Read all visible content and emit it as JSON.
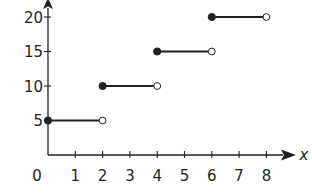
{
  "chart_data": {
    "type": "step",
    "title": "",
    "xlabel": "x",
    "ylabel": "",
    "xlim": [
      0,
      8
    ],
    "ylim": [
      0,
      20
    ],
    "grid": false,
    "x_ticks": [
      "1",
      "2",
      "3",
      "4",
      "5",
      "6",
      "7",
      "8"
    ],
    "y_ticks": [
      "5",
      "10",
      "15",
      "20"
    ],
    "origin_label": "0",
    "segments": [
      {
        "x_start": 0,
        "x_end": 2,
        "y": 5,
        "start": "closed",
        "end": "open"
      },
      {
        "x_start": 2,
        "x_end": 4,
        "y": 10,
        "start": "closed",
        "end": "open"
      },
      {
        "x_start": 4,
        "x_end": 6,
        "y": 15,
        "start": "closed",
        "end": "open"
      },
      {
        "x_start": 6,
        "x_end": 8,
        "y": 20,
        "start": "closed",
        "end": "open"
      }
    ]
  },
  "colors": {
    "ink": "#231f20",
    "background": "#ffffff"
  }
}
